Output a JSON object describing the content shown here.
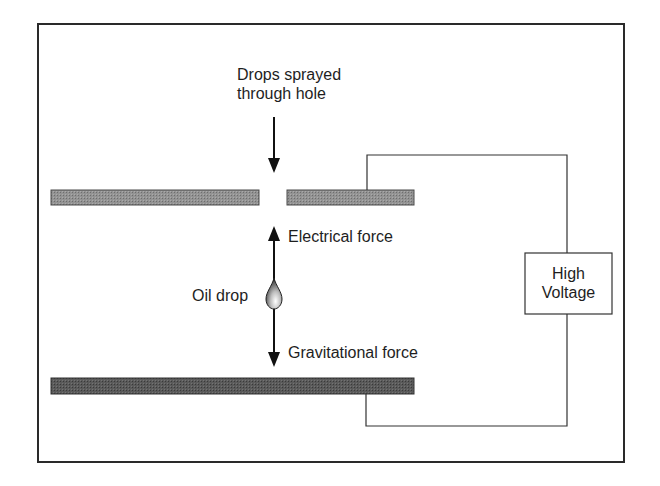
{
  "diagram": {
    "labels": {
      "drops_sprayed_line1": "Drops sprayed",
      "drops_sprayed_line2": "through hole",
      "electrical_force": "Electrical force",
      "oil_drop": "Oil drop",
      "gravitational_force": "Gravitational force",
      "high_voltage_line1": "High",
      "high_voltage_line2": "Voltage"
    },
    "components": [
      {
        "name": "top-plate-left",
        "type": "plate",
        "fill": "#8a8a8a"
      },
      {
        "name": "top-plate-right",
        "type": "plate",
        "fill": "#8a8a8a"
      },
      {
        "name": "bottom-plate",
        "type": "plate",
        "fill": "#555555"
      },
      {
        "name": "high-voltage-source",
        "type": "box"
      },
      {
        "name": "oil-drop",
        "type": "droplet"
      }
    ],
    "arrows": [
      {
        "name": "spray-arrow",
        "direction": "down"
      },
      {
        "name": "electrical-force-arrow",
        "direction": "up"
      },
      {
        "name": "gravitational-force-arrow",
        "direction": "down"
      }
    ],
    "colors": {
      "border": "#2a2a2a",
      "top_plate": "#8a8a8a",
      "bottom_plate": "#555555",
      "wire": "#333333"
    }
  }
}
